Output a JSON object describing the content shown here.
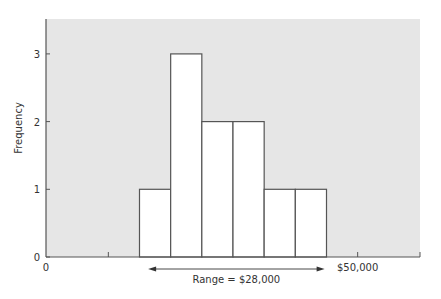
{
  "chart_data": {
    "type": "bar",
    "title": "",
    "xlabel": "",
    "ylabel": "Frequency",
    "bin_width": 5000,
    "bins": [
      {
        "start": 15000,
        "end": 20000,
        "value": 1
      },
      {
        "start": 20000,
        "end": 25000,
        "value": 3
      },
      {
        "start": 25000,
        "end": 30000,
        "value": 2
      },
      {
        "start": 30000,
        "end": 35000,
        "value": 2
      },
      {
        "start": 35000,
        "end": 40000,
        "value": 1
      },
      {
        "start": 40000,
        "end": 45000,
        "value": 1
      }
    ],
    "values": [
      1,
      3,
      2,
      2,
      1,
      1
    ],
    "xlim": [
      0,
      60000
    ],
    "ylim": [
      0,
      3.5
    ],
    "yticks": [
      0,
      1,
      2,
      3
    ],
    "ytick_labels": [
      "0",
      "1",
      "2",
      "3"
    ],
    "xticks": [
      0,
      10000,
      50000
    ],
    "xtick_labels": [
      "0",
      "",
      "$50,000"
    ],
    "annotation": {
      "text": "Range = $28,000",
      "from": 16700,
      "to": 44700
    },
    "colors": {
      "plot_background": "#e6e6e6",
      "bar_fill": "#ffffff",
      "bar_stroke": "#555555",
      "axis": "#555555"
    },
    "grid": false,
    "legend": "none"
  }
}
